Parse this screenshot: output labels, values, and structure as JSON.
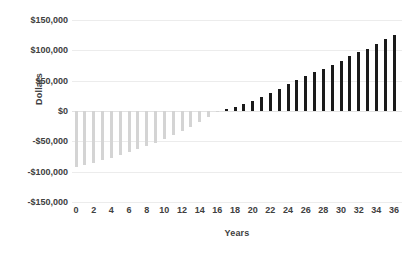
{
  "chart_data": {
    "type": "bar",
    "title": "",
    "xlabel": "Years",
    "ylabel": "Dollars",
    "xlim": [
      0,
      36
    ],
    "ylim": [
      -150000,
      150000
    ],
    "ytick_labels": [
      "$150,000",
      "$100,000",
      "$50,000",
      "$0",
      "-$50,000",
      "-$100,000",
      "-$150,000"
    ],
    "ytick_values": [
      150000,
      100000,
      50000,
      0,
      -50000,
      -100000,
      -150000
    ],
    "xtick_labels": [
      "0",
      "2",
      "4",
      "6",
      "8",
      "10",
      "12",
      "14",
      "16",
      "18",
      "20",
      "22",
      "24",
      "26",
      "28",
      "30",
      "32",
      "34",
      "36"
    ],
    "xtick_values": [
      0,
      2,
      4,
      6,
      8,
      10,
      12,
      14,
      16,
      18,
      20,
      22,
      24,
      26,
      28,
      30,
      32,
      34,
      36
    ],
    "grid": true,
    "legend": "none",
    "categories": [
      0,
      1,
      2,
      3,
      4,
      5,
      6,
      7,
      8,
      9,
      10,
      11,
      12,
      13,
      14,
      15,
      16,
      17,
      18,
      19,
      20,
      21,
      22,
      23,
      24,
      25,
      26,
      27,
      28,
      29,
      30,
      31,
      32,
      33,
      34,
      35,
      36
    ],
    "values": [
      -92000,
      -89000,
      -85000,
      -81000,
      -77000,
      -72000,
      -68000,
      -63000,
      -58000,
      -52000,
      -46000,
      -40000,
      -33000,
      -26000,
      -18000,
      -10000,
      -2000,
      3000,
      7000,
      12000,
      17000,
      23000,
      30000,
      37000,
      44000,
      51000,
      58000,
      64000,
      70000,
      76000,
      83000,
      90000,
      97000,
      103000,
      111000,
      118000,
      125000
    ],
    "colors": {
      "negative_bar": "#d4d4d4",
      "positive_bar": "#1a1a1a",
      "gridline": "#ececec",
      "text": "#404040",
      "background": "#ffffff"
    }
  }
}
